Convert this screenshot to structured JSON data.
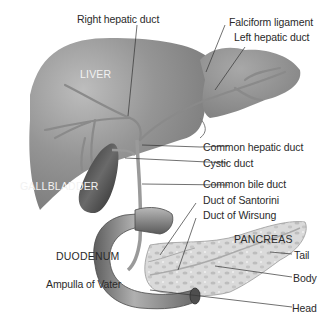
{
  "diagram": {
    "organs": {
      "liver": "LIVER",
      "gallbladder": "GALLBLADDER",
      "duodenum": "DUODENUM",
      "pancreas": "PANCREAS"
    },
    "labels": {
      "right_hepatic_duct": "Right hepatic duct",
      "falciform_ligament": "Falciform ligament",
      "left_hepatic_duct": "Left hepatic duct",
      "common_hepatic_duct": "Common hepatic duct",
      "cystic_duct": "Cystic duct",
      "common_bile_duct": "Common bile duct",
      "duct_of_santorini": "Duct of Santorini",
      "duct_of_wirsung": "Duct of Wirsung",
      "tail": "Tail",
      "body": "Body",
      "head": "Head",
      "ampulla_of_vater": "Ampulla of Vater"
    },
    "colors": {
      "background": "#ffffff",
      "liver": "#8e8e8e",
      "liver_highlight": "#b4b4b4",
      "gallbladder": "#4a4a4a",
      "duodenum": "#7a7a7a",
      "pancreas": "#d6d6d6",
      "duct": "#9a9a9a",
      "leader_line": "#333333",
      "label_text": "#2a2a2a"
    }
  }
}
